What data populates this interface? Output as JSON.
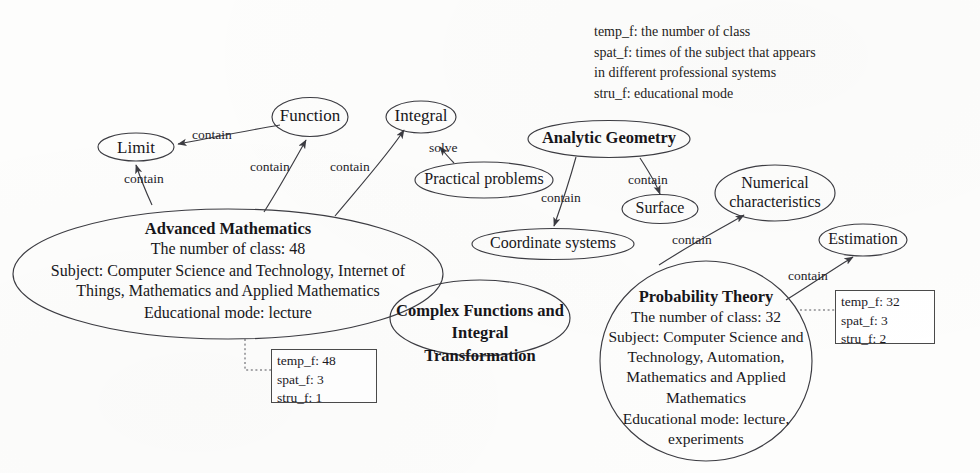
{
  "legend": {
    "name": "feature-legend",
    "lines": "temp_f: the number of class\nspat_f: times of the subject that appears\nin different professional systems\nstru_f:  educational mode"
  },
  "nodes": {
    "limit": {
      "label": "Limit"
    },
    "function": {
      "label": "Function"
    },
    "integral": {
      "label": "Integral"
    },
    "practical_problems": {
      "label": "Practical problems"
    },
    "analytic_geometry": {
      "label": "Analytic Geometry"
    },
    "coordinate_systems": {
      "label": "Coordinate systems"
    },
    "surface": {
      "label": "Surface"
    },
    "numerical_characteristics": {
      "label": "Numerical\ncharacteristics"
    },
    "estimation": {
      "label": "Estimation"
    },
    "advanced_mathematics": {
      "title": "Advanced Mathematics",
      "class_count": "The number of class: 48",
      "subject": "Subject: Computer Science and Technology, Internet of\nThings,  Mathematics and Applied Mathematics",
      "mode": "Educational mode: lecture"
    },
    "complex_functions": {
      "title": "Complex Functions and\nIntegral Transformation"
    },
    "probability_theory": {
      "title": "Probability Theory",
      "class_count": "The number of class: 32",
      "subject": "Subject: Computer Science and\nTechnology, Automation,\nMathematics and Applied\nMathematics",
      "mode": "Educational mode: lecture,\nexperiments"
    }
  },
  "edge_labels": {
    "function_to_limit": "contain",
    "am_to_limit": "contain",
    "am_to_function": "contain",
    "am_to_integral": "contain",
    "practical_to_integral": "solve",
    "ag_to_coordinate": "contain",
    "ag_to_surface": "contain",
    "pt_to_numerical": "contain",
    "pt_to_estimation": "contain"
  },
  "feature_boxes": {
    "advanced_mathematics": {
      "temp_f": "temp_f: 48",
      "spat_f": "spat_f: 3",
      "stru_f": "stru_f:  1"
    },
    "probability_theory": {
      "temp_f": "temp_f: 32",
      "spat_f": "spat_f: 3",
      "stru_f": "stru_f: 2"
    }
  },
  "colors": {
    "stroke": "#3c3c42",
    "text": "#17161a",
    "box_border": "#4a4a4a",
    "background": "#fdfdfc"
  }
}
